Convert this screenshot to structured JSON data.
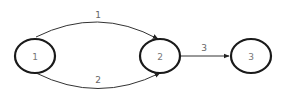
{
  "diagram": {
    "type": "directed-graph",
    "colors": {
      "node_stroke": "#1a1a1a",
      "edge_stroke": "#333333",
      "label": "#666666"
    },
    "nodes": [
      {
        "id": "n1",
        "label": "1"
      },
      {
        "id": "n2",
        "label": "2"
      },
      {
        "id": "n3",
        "label": "3"
      }
    ],
    "edges": [
      {
        "id": "e1",
        "from": "n1",
        "to": "n2",
        "label": "1",
        "style": "curved-upper"
      },
      {
        "id": "e2",
        "from": "n1",
        "to": "n2",
        "label": "2",
        "style": "curved-lower"
      },
      {
        "id": "e3",
        "from": "n2",
        "to": "n3",
        "label": "3",
        "style": "straight"
      }
    ]
  }
}
